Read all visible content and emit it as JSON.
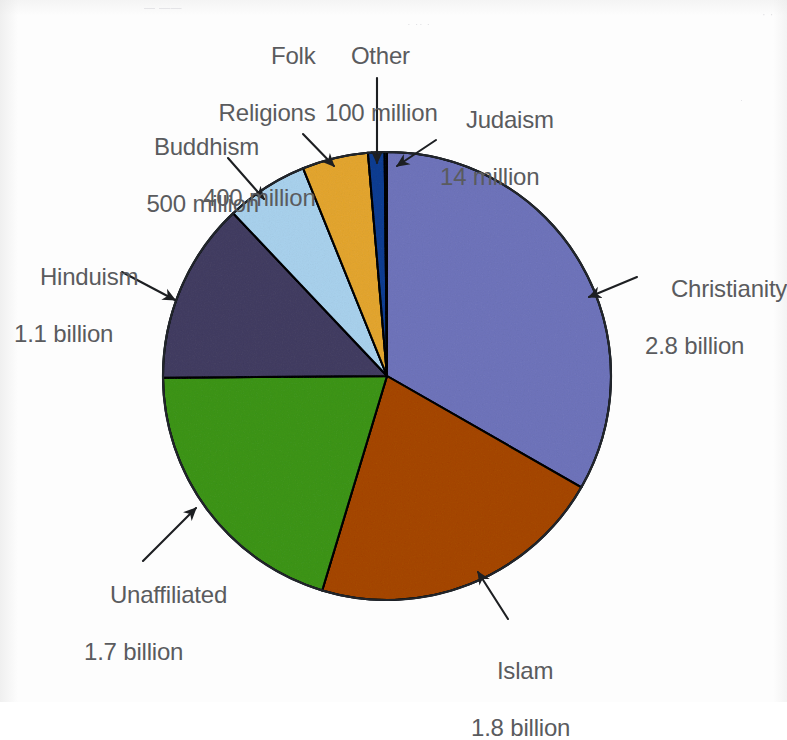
{
  "page": {
    "background_color": "#fdfdfd",
    "text_color": "#5a5b5e",
    "ghost_marks": {
      "top_left": "— ——",
      "top_middle": "· ·· ·",
      "top_right": "· ·",
      "right_upper": "·"
    }
  },
  "chart_data": {
    "type": "pie",
    "title": "",
    "subtitle": "",
    "units": "adherents",
    "total_label": "",
    "legend_position": "callout-labels",
    "grid": false,
    "start_angle_deg": -90,
    "direction": "clockwise",
    "center": {
      "x": 387,
      "y": 376
    },
    "radius": 224,
    "slices": [
      {
        "name": "Christianity",
        "value_label": "2.8 billion",
        "value": 2800000000,
        "color": "#a7abda",
        "percent": 35.7
      },
      {
        "name": "Islam",
        "value_label": "1.8 billion",
        "value": 1800000000,
        "color": "#cd8520",
        "percent": 23.0
      },
      {
        "name": "Unaffiliated",
        "value_label": "1.7 billion",
        "value": 1700000000,
        "color": "#7cc24e",
        "percent": 21.7
      },
      {
        "name": "Hinduism",
        "value_label": "1.1 billion",
        "value": 1100000000,
        "color": "#817c9d",
        "percent": 14.0
      },
      {
        "name": "Buddhism",
        "value_label": "500 million",
        "value": 500000000,
        "color": "#cfe7f6",
        "percent": 6.4
      },
      {
        "name": "Folk Religions",
        "value_label": "400 million",
        "value": 400000000,
        "color": "#f1cd6d",
        "percent": 5.1
      },
      {
        "name": "Other",
        "value_label": "100 million",
        "value": 100000000,
        "color": "#3f7cc0",
        "percent": 1.3
      },
      {
        "name": "Judaism",
        "value_label": "14 million",
        "value": 14000000,
        "color": "#2a4f93",
        "percent": 0.18
      }
    ],
    "stroke_color": "#21252b",
    "stroke_width": 2
  },
  "labels": {
    "folk_religions": {
      "line1": "Folk",
      "line2": "Religions",
      "line3": "400 million"
    },
    "other": {
      "line1": "Other",
      "line2": "100 million"
    },
    "judaism": {
      "line1": "Judaism",
      "line2": "14 million"
    },
    "buddhism": {
      "line1": "Buddhism",
      "line2": "500 million"
    },
    "hinduism": {
      "line1": "Hinduism",
      "line2": "1.1 billion"
    },
    "christianity": {
      "line1": "Christianity",
      "line2": "2.8 billion"
    },
    "unaffiliated": {
      "line1": "Unaffiliated",
      "line2": "1.7 billion"
    },
    "islam": {
      "line1": "Islam",
      "line2": "1.8 billion"
    }
  }
}
